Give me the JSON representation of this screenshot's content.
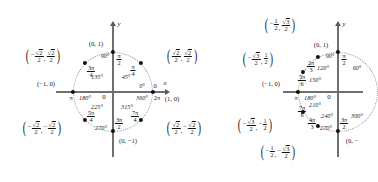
{
  "figure": {
    "type": "unit-circle-diagram-pair",
    "panels": [
      {
        "id": "left",
        "name": "unit-circle-45-degree-family",
        "axis_x_label": "x",
        "axis_y_label": "y",
        "origin_label": "0",
        "points": [
          {
            "angle_deg": "0°",
            "angle_deg2": "360°",
            "radian_num": "",
            "radian_den": "",
            "radian_plain": "0",
            "radian_plain2": "2π",
            "coord": "(1, 0)"
          },
          {
            "angle_deg": "45°",
            "radian_num": "π",
            "radian_den": "4",
            "coord_x_num": "√2",
            "coord_x_den": "2",
            "coord_y_num": "√2",
            "coord_y_den": "2",
            "coord_x_sign": "",
            "coord_y_sign": ""
          },
          {
            "angle_deg": "90°",
            "radian_num": "π",
            "radian_den": "2",
            "coord": "(0, 1)"
          },
          {
            "angle_deg": "135°",
            "radian_num": "3π",
            "radian_den": "4",
            "coord_x_num": "√2",
            "coord_x_den": "2",
            "coord_y_num": "√2",
            "coord_y_den": "2",
            "coord_x_sign": "−",
            "coord_y_sign": ""
          },
          {
            "angle_deg": "180°",
            "radian_plain": "π",
            "coord": "(−1, 0)"
          },
          {
            "angle_deg": "225°",
            "radian_num": "5π",
            "radian_den": "4",
            "coord_x_num": "√2",
            "coord_x_den": "2",
            "coord_y_num": "√2",
            "coord_y_den": "2",
            "coord_x_sign": "−",
            "coord_y_sign": "−"
          },
          {
            "angle_deg": "270°",
            "radian_num": "3π",
            "radian_den": "2",
            "coord": "(0, −1)"
          },
          {
            "angle_deg": "315°",
            "radian_num": "7π",
            "radian_den": "4",
            "coord_x_num": "√2",
            "coord_x_den": "2",
            "coord_y_num": "√2",
            "coord_y_den": "2",
            "coord_x_sign": "",
            "coord_y_sign": "−"
          }
        ]
      },
      {
        "id": "right",
        "name": "unit-circle-30-60-degree-family",
        "axis_y_label": "y",
        "origin_label": "0",
        "points": [
          {
            "angle_deg": "60°"
          },
          {
            "angle_deg": "90°",
            "radian_num": "π",
            "radian_den": "2",
            "coord": "(0, 1)"
          },
          {
            "angle_deg": "120°",
            "radian_num": "2π",
            "radian_den": "3",
            "coord_x_sign": "−",
            "coord_x_num": "1",
            "coord_x_den": "2",
            "coord_y_sign": "",
            "coord_y_num": "√3",
            "coord_y_den": "2"
          },
          {
            "angle_deg": "150°",
            "radian_num": "5π",
            "radian_den": "6",
            "coord_x_sign": "−",
            "coord_x_num": "√3",
            "coord_x_den": "2",
            "coord_y_sign": "",
            "coord_y_num": "1",
            "coord_y_den": "2"
          },
          {
            "angle_deg": "180°",
            "radian_plain": "π",
            "coord": "(−1, 0)"
          },
          {
            "angle_deg": "210°",
            "radian_num": "7π",
            "radian_den": "6",
            "coord_x_sign": "−",
            "coord_x_num": "√3",
            "coord_x_den": "2",
            "coord_y_sign": "−",
            "coord_y_num": "1",
            "coord_y_den": "2"
          },
          {
            "angle_deg": "240°",
            "radian_num": "4π",
            "radian_den": "3",
            "coord_x_sign": "−",
            "coord_x_num": "1",
            "coord_x_den": "2",
            "coord_y_sign": "−",
            "coord_y_num": "√3",
            "coord_y_den": "2"
          },
          {
            "angle_deg": "270°",
            "radian_num": "3π",
            "radian_den": "2",
            "coord": "(0, −1)"
          },
          {
            "angle_deg": "300°"
          }
        ]
      }
    ]
  },
  "left": {
    "axis_x": "x",
    "axis_y": "y",
    "origin": "0",
    "deg_0": "0°",
    "rad_0": "0",
    "deg_360": "360°",
    "rad_2pi": "2π",
    "coord_1_0": "(1, 0)",
    "deg_45": "45°",
    "deg_90": "90°",
    "coord_0_1": "(0, 1)",
    "deg_135": "135°",
    "deg_180": "180°",
    "rad_pi": "π",
    "coord_m1_0": "(−1, 0)",
    "deg_225": "225°",
    "deg_270": "270°",
    "coord_0_m1": "(0, −1)",
    "deg_315": "315°",
    "pi_num": "π",
    "pi4_den": "4",
    "pi2_den": "2",
    "r3pi_num": "3π",
    "r3pi4_den": "4",
    "r5pi_num": "5π",
    "r5pi4_den": "4",
    "r3pi2_num": "3π",
    "r3pi2_den": "2",
    "r7pi_num": "7π",
    "r7pi4_den": "4",
    "sqrt2": "2",
    "two": "2"
  },
  "right": {
    "axis_y": "y",
    "origin": "0",
    "deg_60": "60°",
    "deg_90": "90°",
    "coord_0_1": "(0, 1)",
    "deg_120": "120°",
    "deg_150": "150°",
    "deg_180": "180°",
    "rad_pi": "π",
    "coord_m1_0": "(−1, 0)",
    "deg_210": "210°",
    "deg_240": "240°",
    "deg_270": "270°",
    "deg_300": "300°",
    "coord_0_m1_partial": "(0, −",
    "pi_num": "π",
    "pi2_den": "2",
    "r2pi_num": "2π",
    "r2pi3_den": "3",
    "r5pi_num": "5π",
    "r5pi6_den": "6",
    "r7pi_num": "7π",
    "r7pi6_den": "6",
    "r4pi_num": "4π",
    "r4pi3_den": "3",
    "r3pi_num": "3π",
    "r3pi2_den": "2",
    "one": "1",
    "two": "2",
    "three": "3",
    "sqrt3": "3"
  }
}
